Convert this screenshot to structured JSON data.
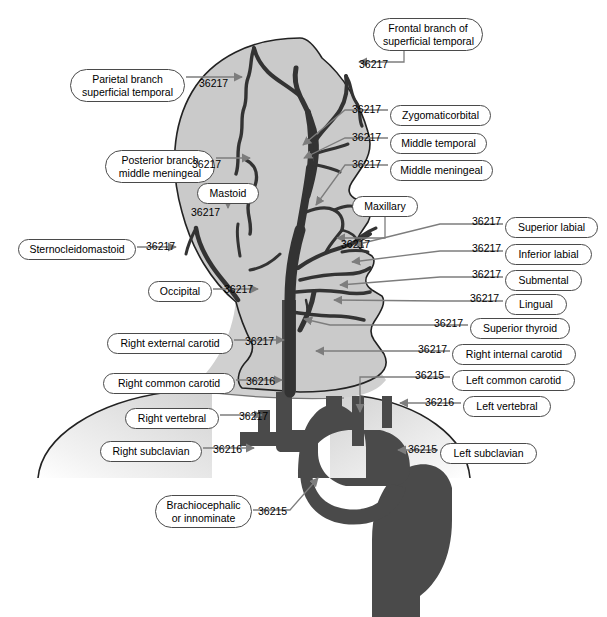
{
  "figure": {
    "colors": {
      "head_fill": "#cacaca",
      "vessel_dark": "#333333",
      "aorta_fill": "#4a4a4a",
      "arrow": "#7d7d7d",
      "outline": "#222222",
      "label_border": "#4a4a4a",
      "label_fill": "#ffffff"
    }
  },
  "labels": [
    {
      "id": "frontal-branch-superficial-temporal",
      "text": "Frontal branch of\nsuperficial temporal",
      "code": "36217",
      "x": 373,
      "y": 18,
      "w": 110,
      "cx": 359,
      "cy": 58
    },
    {
      "id": "parietal-branch-superficial-temporal",
      "text": "Parietal branch\nsuperficial temporal",
      "code": "36217",
      "x": 70,
      "y": 69,
      "w": 115,
      "cx": 199,
      "cy": 77
    },
    {
      "id": "zygomaticorbital",
      "text": "Zygomaticorbital",
      "code": "36217",
      "x": 390,
      "y": 105,
      "w": 101,
      "cx": 352,
      "cy": 103
    },
    {
      "id": "middle-temporal",
      "text": "Middle temporal",
      "code": "36217",
      "x": 390,
      "y": 133,
      "w": 97,
      "cx": 352,
      "cy": 131
    },
    {
      "id": "middle-meningeal",
      "text": "Middle meningeal",
      "code": "36217",
      "x": 390,
      "y": 160,
      "w": 103,
      "cx": 352,
      "cy": 158
    },
    {
      "id": "posterior-branch-middle-meningeal",
      "text": "Posterior branch\nmiddle meningeal",
      "code": "36217",
      "x": 105,
      "y": 150,
      "w": 110,
      "cx": 192,
      "cy": 158
    },
    {
      "id": "mastoid",
      "text": "Mastoid",
      "code": "36217",
      "x": 197,
      "y": 183,
      "w": 62,
      "cx": 191,
      "cy": 206
    },
    {
      "id": "maxillary",
      "text": "Maxillary",
      "code": "36217",
      "x": 352,
      "y": 196,
      "w": 66,
      "cx": 341,
      "cy": 238
    },
    {
      "id": "sternocleidomastoid",
      "text": "Sternocleidomastoid",
      "code": "36217",
      "x": 18,
      "y": 239,
      "w": 118,
      "cx": 146,
      "cy": 240
    },
    {
      "id": "occipital",
      "text": "Occipital",
      "code": "36217",
      "x": 148,
      "y": 281,
      "w": 64,
      "cx": 224,
      "cy": 283
    },
    {
      "id": "superior-labial",
      "text": "Superior labial",
      "code": "36217",
      "x": 505,
      "y": 217,
      "w": 93,
      "cx": 472,
      "cy": 215
    },
    {
      "id": "inferior-labial",
      "text": "Inferior labial",
      "code": "36217",
      "x": 505,
      "y": 244,
      "w": 87,
      "cx": 472,
      "cy": 242
    },
    {
      "id": "submental",
      "text": "Submental",
      "code": "36217",
      "x": 505,
      "y": 270,
      "w": 77,
      "cx": 472,
      "cy": 268
    },
    {
      "id": "lingual",
      "text": "Lingual",
      "code": "36217",
      "x": 505,
      "y": 294,
      "w": 62,
      "cx": 470,
      "cy": 292
    },
    {
      "id": "superior-thyroid",
      "text": "Superior thyroid",
      "code": "36217",
      "x": 470,
      "y": 318,
      "w": 100,
      "cx": 434,
      "cy": 317
    },
    {
      "id": "right-external-carotid",
      "text": "Right external carotid",
      "code": "36217",
      "x": 107,
      "y": 333,
      "w": 126,
      "cx": 245,
      "cy": 335
    },
    {
      "id": "right-internal-carotid",
      "text": "Right internal carotid",
      "code": "36217",
      "x": 452,
      "y": 344,
      "w": 124,
      "cx": 418,
      "cy": 343
    },
    {
      "id": "right-common-carotid",
      "text": "Right common carotid",
      "code": "36216",
      "x": 103,
      "y": 373,
      "w": 132,
      "cx": 246,
      "cy": 375
    },
    {
      "id": "left-common-carotid",
      "text": "Left common carotid",
      "code": "36215",
      "x": 452,
      "y": 370,
      "w": 123,
      "cx": 415,
      "cy": 369
    },
    {
      "id": "right-vertebral",
      "text": "Right vertebral",
      "code": "36217",
      "x": 125,
      "y": 408,
      "w": 94,
      "cx": 239,
      "cy": 410
    },
    {
      "id": "left-vertebral",
      "text": "Left vertebral",
      "code": "36216",
      "x": 463,
      "y": 396,
      "w": 88,
      "cx": 425,
      "cy": 396
    },
    {
      "id": "right-subclavian",
      "text": "Right subclavian",
      "code": "36216",
      "x": 100,
      "y": 441,
      "w": 102,
      "cx": 213,
      "cy": 443
    },
    {
      "id": "left-subclavian",
      "text": "Left subclavian",
      "code": "36215",
      "x": 440,
      "y": 443,
      "w": 97,
      "cx": 408,
      "cy": 443
    },
    {
      "id": "brachiocephalic-or-innominate",
      "text": "Brachiocephalic\nor innominate",
      "code": "36215",
      "x": 155,
      "y": 495,
      "w": 97,
      "cx": 258,
      "cy": 505
    }
  ]
}
